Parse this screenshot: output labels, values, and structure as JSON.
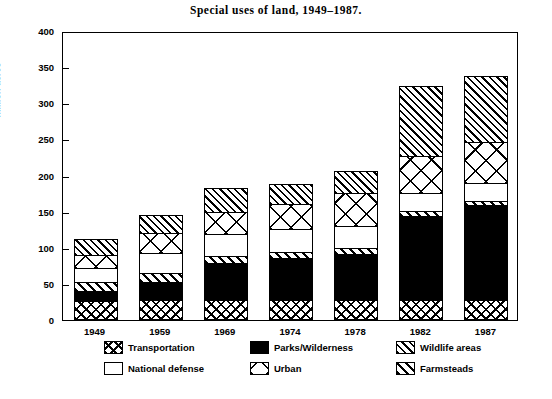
{
  "chart_data": {
    "type": "bar",
    "title": "Special uses of land, 1949–1987.",
    "xlabel": "",
    "ylabel": "million acres",
    "ylim": [
      0,
      400
    ],
    "yticks": [
      0,
      50,
      100,
      150,
      200,
      250,
      300,
      350,
      400
    ],
    "grid": false,
    "stacked": true,
    "legend_position": "bottom",
    "categories": [
      "1949",
      "1959",
      "1969",
      "1974",
      "1978",
      "1982",
      "1987"
    ],
    "series": [
      {
        "name": "Transportation",
        "pattern": "cross-hatch",
        "values": [
          25,
          26,
          26,
          26,
          26,
          27,
          27
        ]
      },
      {
        "name": "Parks/Wilderness",
        "pattern": "solid-black",
        "values": [
          14,
          25,
          51,
          58,
          64,
          115,
          131
        ]
      },
      {
        "name": "Farmsteads",
        "pattern": "diagonal-thick",
        "values": [
          12,
          12,
          10,
          9,
          8,
          7,
          6
        ]
      },
      {
        "name": "National defense",
        "pattern": "white",
        "values": [
          19,
          28,
          30,
          31,
          31,
          25,
          24
        ]
      },
      {
        "name": "Urban",
        "pattern": "x-box",
        "values": [
          18,
          28,
          31,
          35,
          45,
          51,
          57
        ]
      },
      {
        "name": "Wildlife areas",
        "pattern": "diagonal-fine",
        "values": [
          23,
          25,
          33,
          28,
          31,
          97,
          91
        ]
      }
    ],
    "totals": [
      111,
      144,
      181,
      187,
      205,
      322,
      336
    ]
  },
  "legend": {
    "items": [
      {
        "label": "Transportation",
        "pattern": "cross-hatch"
      },
      {
        "label": "Parks/Wilderness",
        "pattern": "solid-black"
      },
      {
        "label": "Wildlife areas",
        "pattern": "diagonal-fine"
      },
      {
        "label": "National defense",
        "pattern": "white"
      },
      {
        "label": "Urban",
        "pattern": "x-box"
      },
      {
        "label": "Farmsteads",
        "pattern": "diagonal-thick"
      }
    ]
  },
  "colors": {
    "ink": "#000000",
    "paper": "#ffffff"
  }
}
